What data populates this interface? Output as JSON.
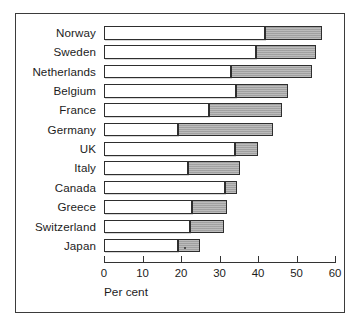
{
  "chart_data": {
    "type": "bar",
    "orientation": "horizontal",
    "stacked": true,
    "title": "",
    "subtitle": "",
    "xlabel": "Per cent",
    "ylabel": "",
    "xlim": [
      0,
      60
    ],
    "ylim": null,
    "grid": false,
    "legend": null,
    "legend_position": "none",
    "xticks": [
      0,
      10,
      20,
      30,
      40,
      50,
      60
    ],
    "xtick_labels": [
      "0",
      "10",
      "20",
      "30",
      "40",
      "50",
      "60"
    ],
    "categories": [
      "Norway",
      "Sweden",
      "Netherlands",
      "Belgium",
      "France",
      "Germany",
      "UK",
      "Italy",
      "Canada",
      "Greece",
      "Switzerland",
      "Japan"
    ],
    "series": [
      {
        "name": "segment-1",
        "fill": "white",
        "values": [
          41.8,
          39.5,
          33.0,
          34.3,
          27.3,
          19.2,
          34.0,
          21.8,
          31.4,
          22.9,
          22.3,
          19.2
        ]
      },
      {
        "name": "segment-2",
        "fill": "grey",
        "values": [
          14.8,
          15.5,
          21.0,
          13.5,
          18.9,
          24.8,
          6.0,
          13.5,
          3.1,
          9.1,
          8.9,
          5.8
        ]
      }
    ],
    "totals": [
      56.6,
      55.0,
      54.0,
      47.8,
      46.2,
      44.0,
      40.0,
      35.3,
      34.5,
      32.0,
      31.2,
      25.0
    ],
    "colors": {
      "segment_1_fill": "#ffffff",
      "segment_2_fill": "#a9a9a9",
      "bar_outline": "#2e2e2e",
      "axis": "#333333",
      "frame": "#3b3b3b",
      "text": "#1c1c1c",
      "background": "#ffffff"
    },
    "geometry": {
      "x0_px": 104,
      "px_per_unit": 3.85,
      "row_top_px": 26,
      "row_pitch_px": 19.35,
      "bar_height_px": 13.5
    }
  }
}
